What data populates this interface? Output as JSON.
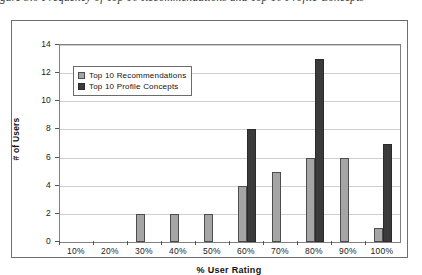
{
  "caption": {
    "text": "gure 5.6 Frequency of Top 10 Recommendations and Top 10 Profile Concepts"
  },
  "chart_data": {
    "type": "bar",
    "title": "",
    "xlabel": "% User Rating",
    "ylabel": "# of Users",
    "categories": [
      "10%",
      "20%",
      "30%",
      "40%",
      "50%",
      "60%",
      "70%",
      "80%",
      "90%",
      "100%"
    ],
    "series": [
      {
        "name": "Top 10 Recommendations",
        "color": "#a5a5a5",
        "values": [
          0,
          0,
          2,
          2,
          2,
          4,
          5,
          6,
          6,
          1
        ]
      },
      {
        "name": "Top 10 Profile Concepts",
        "color": "#3b3b3b",
        "values": [
          0,
          0,
          0,
          0,
          0,
          8,
          0,
          13,
          0,
          7
        ]
      }
    ],
    "ylim": [
      0,
      14
    ],
    "yticks": [
      0,
      2,
      4,
      6,
      8,
      10,
      12,
      14
    ],
    "grid": true,
    "legend_position": "top-left-inside"
  }
}
